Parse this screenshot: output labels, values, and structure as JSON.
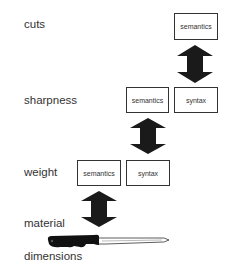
{
  "levels": [
    {
      "label": "cuts",
      "boxes": [
        "semantics"
      ]
    },
    {
      "label": "sharpness",
      "boxes": [
        "semantics",
        "syntax"
      ]
    },
    {
      "label": "weight",
      "boxes": [
        "semantics",
        "syntax"
      ]
    },
    {
      "label": "material",
      "boxes": []
    },
    {
      "label": "dimensions",
      "boxes": []
    }
  ],
  "icons": {
    "arrow": "double-headed-vertical-arrow",
    "knife": "kitchen-knife"
  },
  "colors": {
    "ink": "#1a1a1a",
    "text": "#333333",
    "background": "#ffffff"
  }
}
